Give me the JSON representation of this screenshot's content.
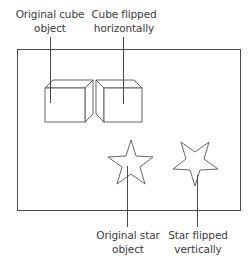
{
  "labels": {
    "cube_original": {
      "line1": "Original cube",
      "line2": "object"
    },
    "cube_flipped": {
      "line1": "Cube flipped",
      "line2": "horizontally"
    },
    "star_original": {
      "line1": "Original star",
      "line2": "object"
    },
    "star_flipped": {
      "line1": "Star flipped",
      "line2": "vertically"
    }
  },
  "objects": [
    {
      "name": "original-cube",
      "shape": "cube",
      "transform": "none"
    },
    {
      "name": "flipped-cube",
      "shape": "cube",
      "transform": "flip-horizontal"
    },
    {
      "name": "original-star",
      "shape": "star",
      "transform": "none"
    },
    {
      "name": "flipped-star",
      "shape": "star",
      "transform": "flip-vertical"
    }
  ],
  "colors": {
    "line": "#4a4a4a",
    "text": "#3c3c3c",
    "background": "#ffffff"
  }
}
